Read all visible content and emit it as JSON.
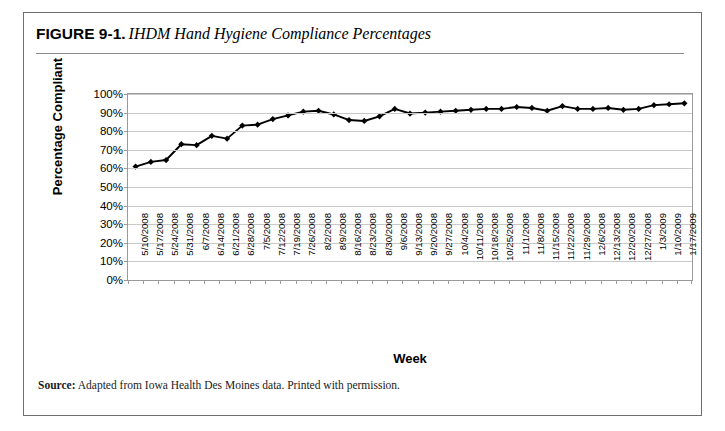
{
  "figure": {
    "number": "FIGURE 9-1.",
    "title": "IHDM Hand Hygiene Compliance Percentages",
    "source_label": "Source:",
    "source_text": "Adapted from Iowa Health Des Moines data. Printed with permission."
  },
  "chart_data": {
    "type": "line",
    "title": "IHDM Hand Hygiene Compliance Percentages",
    "xlabel": "Week",
    "ylabel": "Percentage Compliant",
    "ylim": [
      0,
      100
    ],
    "ytick_labels": [
      "100%",
      "90%",
      "80%",
      "70%",
      "60%",
      "50%",
      "40%",
      "30%",
      "20%",
      "10%",
      "0%"
    ],
    "ytick_values": [
      100,
      90,
      80,
      70,
      60,
      50,
      40,
      30,
      20,
      10,
      0
    ],
    "grid": true,
    "legend": "none",
    "marker": "diamond",
    "line_color": "#000000",
    "marker_color": "#000000",
    "categories": [
      "5/10/2008",
      "5/17/2008",
      "5/24/2008",
      "5/31/2008",
      "6/7/2008",
      "6/14/2008",
      "6/21/2008",
      "6/28/2008",
      "7/5/2008",
      "7/12/2008",
      "7/19/2008",
      "7/26/2008",
      "8/2/2008",
      "8/9/2008",
      "8/16/2008",
      "8/23/2008",
      "8/30/2008",
      "9/6/2008",
      "9/13/2008",
      "9/20/2008",
      "9/27/2008",
      "10/4/2008",
      "10/11/2008",
      "10/18/2008",
      "10/25/2008",
      "11/1/2008",
      "11/8/2008",
      "11/15/2008",
      "11/22/2008",
      "11/29/2008",
      "12/6/2008",
      "12/13/2008",
      "12/20/2008",
      "12/27/2008",
      "1/3/2009",
      "1/10/2009",
      "1/17/2009"
    ],
    "values": [
      61,
      63.5,
      64.5,
      73,
      72.5,
      77.5,
      76,
      83,
      83.5,
      86.5,
      88.5,
      90.5,
      91,
      89,
      86,
      85.5,
      88,
      92,
      89.5,
      90,
      90.5,
      91,
      91.5,
      92,
      92,
      93,
      92.5,
      91,
      93.5,
      92,
      92,
      92.5,
      91.5,
      92,
      94,
      94.5,
      95
    ]
  }
}
